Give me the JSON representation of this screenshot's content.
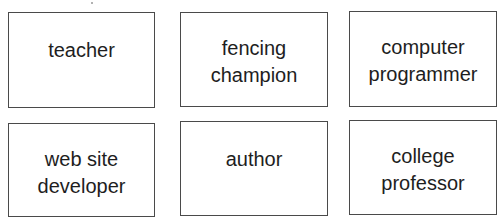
{
  "cards": [
    {
      "lines": [
        "teacher"
      ]
    },
    {
      "lines": [
        "fencing",
        "champion"
      ]
    },
    {
      "lines": [
        "computer",
        "programmer"
      ]
    },
    {
      "lines": [
        "web site",
        "developer"
      ]
    },
    {
      "lines": [
        "author"
      ]
    },
    {
      "lines": [
        "college",
        "professor"
      ]
    }
  ],
  "colors": {
    "border": "#4a4a4a",
    "text": "#1e1e1e",
    "background": "#ffffff"
  }
}
